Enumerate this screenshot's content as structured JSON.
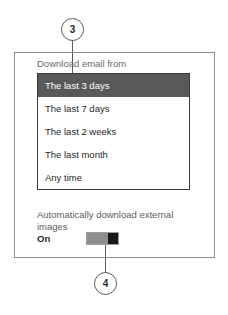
{
  "callouts": [
    {
      "number": "3"
    },
    {
      "number": "4"
    }
  ],
  "panel": {
    "field": {
      "label": "Download email from",
      "selected_value": "The last 3 days",
      "options": [
        {
          "label": "The last 3 days",
          "selected": true
        },
        {
          "label": "The last 7 days",
          "selected": false
        },
        {
          "label": "The last 2 weeks",
          "selected": false
        },
        {
          "label": "The last month",
          "selected": false
        },
        {
          "label": "Any time",
          "selected": false
        }
      ]
    },
    "external_images": {
      "label": "Automatically download external images",
      "state_label": "On",
      "toggle_on": true
    }
  },
  "colors": {
    "selection": "#595959",
    "panel_border": "#8c8c8c",
    "listbox_border": "#3a3a3a",
    "toggle_track": "#8e8e8e",
    "toggle_thumb": "#1a1a1a",
    "label_text": "#6b6b6b",
    "body_text": "#1f1f1f"
  }
}
